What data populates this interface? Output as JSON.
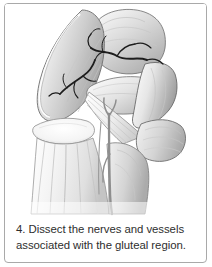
{
  "card": {
    "border_color": "#a9a9a9",
    "background": "#ffffff"
  },
  "figure": {
    "alt": "Grayscale anatomical illustration of the gluteal region with the gluteus maximus reflected laterally, exposing the gluteal nerves and vessels, piriformis, sciatic nerve and hamstring origins",
    "style": "grayscale pencil and wash medical illustration",
    "ink_color": "#1d1d1d",
    "muscle_light": "#fbfbfb",
    "muscle_mid": "#d7d7d7",
    "muscle_dark": "#9a9a9a",
    "outline_color": "#5a5a5a",
    "structures": [
      "reflected gluteus maximus flap",
      "gluteus medius",
      "superior gluteal nerve and vessels",
      "inferior gluteal nerve and vessels",
      "piriformis",
      "greater trochanter",
      "sciatic nerve",
      "hamstring muscles",
      "sacrotuberous ligament"
    ]
  },
  "caption": {
    "number": "4.",
    "line1": "4. Dissect the nerves and vessels",
    "line2": "associated with the gluteal region.",
    "full_text": "4. Dissect the nerves and vessels associated with the gluteal region.",
    "color": "#2e2e2e"
  }
}
